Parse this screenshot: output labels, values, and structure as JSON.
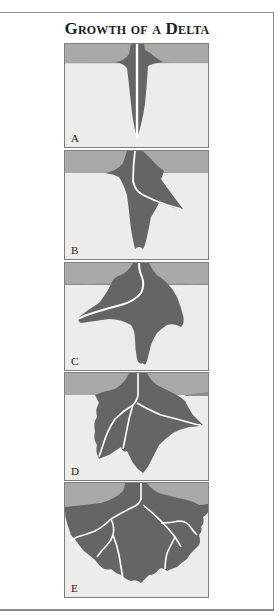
{
  "title": "Growth of a Delta",
  "colors": {
    "land": "#a9a9a8",
    "sea": "#ececeb",
    "delta": "#656566",
    "channel": "#ffffff",
    "border": "#7d7d7d"
  },
  "panels": [
    {
      "label": "A",
      "stage": 1
    },
    {
      "label": "B",
      "stage": 2
    },
    {
      "label": "C",
      "stage": 3
    },
    {
      "label": "D",
      "stage": 4
    },
    {
      "label": "E",
      "stage": 5
    }
  ]
}
